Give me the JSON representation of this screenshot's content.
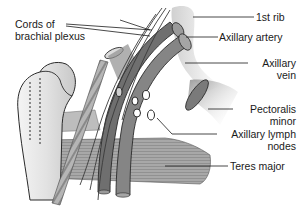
{
  "diagram": {
    "labels": {
      "cords_line1": "Cords of",
      "cords_line2": "brachial plexus",
      "first_rib": "1st rib",
      "axillary_artery": "Axillary artery",
      "axillary_vein_line1": "Axillary",
      "axillary_vein_line2": "vein",
      "pectoralis_line1": "Pectoralis",
      "pectoralis_line2": "minor",
      "lymph_line1": "Axillary lymph",
      "lymph_line2": "nodes",
      "teres_major": "Teres major"
    },
    "colors": {
      "background": "#ffffff",
      "outline": "#2a2a2a",
      "vessel": "#7d7d7d",
      "muscle": "#9a9a9a",
      "bone": "#e6e6e6",
      "text": "#1a1a1a"
    }
  }
}
